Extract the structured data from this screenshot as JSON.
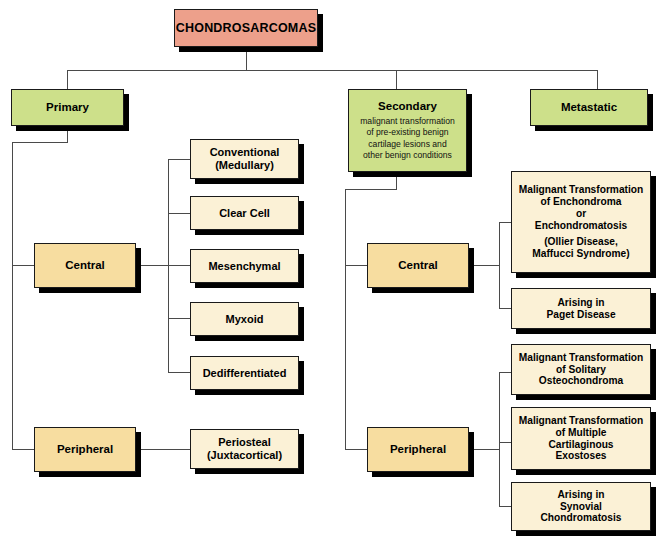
{
  "diagram": {
    "title": "CHONDROSARCOMAS",
    "palette": {
      "root_fill": "#eda08b",
      "level2_fill": "#cde08a",
      "level3_fill": "#f7dda0",
      "leaf_fill": "#fbf1d6",
      "border": "#1a1a1a",
      "connector": "#4a4a4a",
      "shadow": "#000000"
    },
    "root": {
      "label": "CHONDROSARCOMAS"
    },
    "branches": {
      "primary": {
        "label": "Primary"
      },
      "secondary": {
        "label": "Secondary",
        "subtitle_lines": [
          "malignant transformation",
          "of pre-existing benign",
          "cartilage lesions and",
          "other benign conditions"
        ]
      },
      "metastatic": {
        "label": "Metastatic"
      }
    },
    "primary": {
      "central": {
        "label": "Central"
      },
      "peripheral": {
        "label": "Peripheral"
      },
      "central_types": [
        {
          "line1": "Conventional",
          "line2": "(Medullary)"
        },
        {
          "line1": "Clear Cell",
          "line2": ""
        },
        {
          "line1": "Mesenchymal",
          "line2": ""
        },
        {
          "line1": "Myxoid",
          "line2": ""
        },
        {
          "line1": "Dedifferentiated",
          "line2": ""
        }
      ],
      "peripheral_types": [
        {
          "line1": "Periosteal",
          "line2": "(Juxtacortical)"
        }
      ]
    },
    "secondary": {
      "central": {
        "label": "Central"
      },
      "peripheral": {
        "label": "Peripheral"
      },
      "central_items": [
        {
          "lines": [
            "Malignant Transformation",
            "of Enchondroma",
            "or",
            "Enchondromatosis"
          ],
          "paren_lines": [
            "(Ollier Disease,",
            "Maffucci Syndrome)"
          ]
        },
        {
          "lines": [
            "Arising in",
            "Paget Disease"
          ],
          "paren_lines": []
        }
      ],
      "peripheral_items": [
        {
          "lines": [
            "Malignant Transformation",
            "of Solitary",
            "Osteochondroma"
          ],
          "paren_lines": []
        },
        {
          "lines": [
            "Malignant Transformation",
            "of Multiple",
            "Cartilaginous",
            "Exostoses"
          ],
          "paren_lines": []
        },
        {
          "lines": [
            "Arising in",
            "Synovial",
            "Chondromatosis"
          ],
          "paren_lines": []
        }
      ]
    }
  }
}
